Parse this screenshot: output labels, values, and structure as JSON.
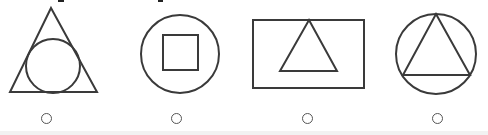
{
  "question": {
    "choices": [
      {
        "id": "A",
        "shape": "circle-inscribed-in-triangle",
        "selected": false
      },
      {
        "id": "B",
        "shape": "square-inscribed-in-circle",
        "selected": false
      },
      {
        "id": "C",
        "shape": "triangle-inside-rectangle",
        "selected": false
      },
      {
        "id": "D",
        "shape": "triangle-inscribed-in-circle",
        "selected": false
      }
    ]
  },
  "colors": {
    "stroke": "#3a3a3a",
    "background": "#ffffff",
    "radio_border": "#555555"
  }
}
